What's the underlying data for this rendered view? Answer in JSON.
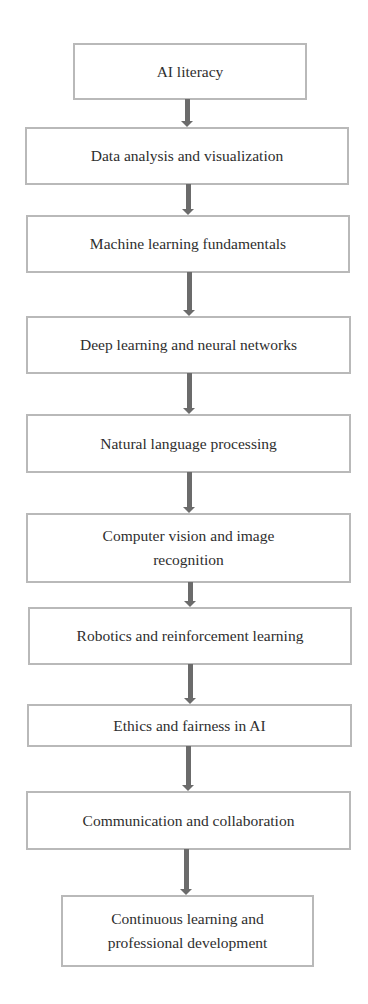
{
  "diagram": {
    "type": "vertical-flowchart",
    "colors": {
      "box_border": "#b9b9b9",
      "box_fill": "#ffffff",
      "text": "#2e2e2e",
      "arrow": "#6b6b6b"
    },
    "steps": [
      {
        "label": "AI literacy",
        "lines": [
          "AI literacy"
        ]
      },
      {
        "label": "Data analysis and visualization",
        "lines": [
          "Data analysis and visualization"
        ]
      },
      {
        "label": "Machine learning fundamentals",
        "lines": [
          "Machine learning fundamentals"
        ]
      },
      {
        "label": "Deep learning and neural networks",
        "lines": [
          "Deep learning and neural networks"
        ]
      },
      {
        "label": "Natural language processing",
        "lines": [
          "Natural language processing"
        ]
      },
      {
        "label": "Computer vision and image recognition",
        "lines": [
          "Computer vision and image",
          "recognition"
        ]
      },
      {
        "label": "Robotics and reinforcement learning",
        "lines": [
          "Robotics and reinforcement learning"
        ]
      },
      {
        "label": "Ethics and fairness in AI",
        "lines": [
          "Ethics and fairness in AI"
        ]
      },
      {
        "label": "Communication and collaboration",
        "lines": [
          "Communication and collaboration"
        ]
      },
      {
        "label": "Continuous learning and professional development",
        "lines": [
          "Continuous learning and",
          "professional development"
        ]
      }
    ],
    "connectors": [
      {
        "from": 0,
        "to": 1
      },
      {
        "from": 1,
        "to": 2
      },
      {
        "from": 2,
        "to": 3
      },
      {
        "from": 3,
        "to": 4
      },
      {
        "from": 4,
        "to": 5
      },
      {
        "from": 5,
        "to": 6
      },
      {
        "from": 6,
        "to": 7
      },
      {
        "from": 7,
        "to": 8
      },
      {
        "from": 8,
        "to": 9
      }
    ]
  }
}
